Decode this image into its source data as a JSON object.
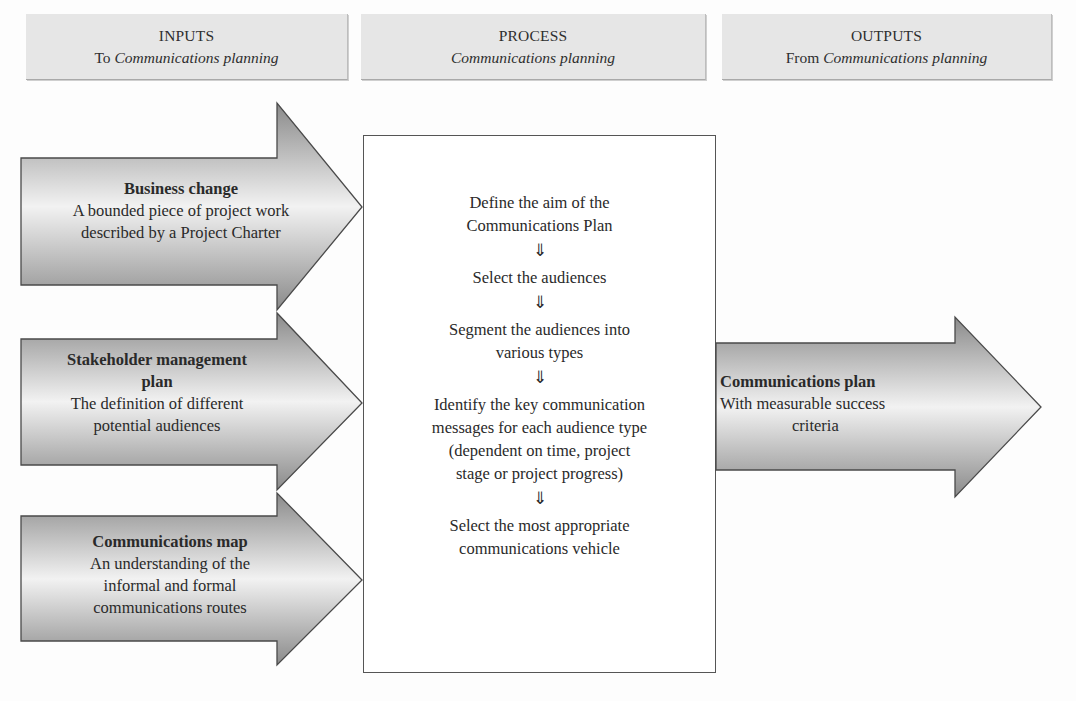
{
  "headers": {
    "inputs": {
      "title": "INPUTS",
      "prefix": "To ",
      "italic": "Communications planning"
    },
    "process": {
      "title": "PROCESS",
      "prefix": "",
      "italic": "Communications planning"
    },
    "outputs": {
      "title": "OUTPUTS",
      "prefix": "From ",
      "italic": "Communications planning"
    }
  },
  "inputs": [
    {
      "title": "Business change",
      "lines": [
        "A bounded piece of project work",
        "described by a Project Charter"
      ]
    },
    {
      "title_lines": [
        "Stakeholder management",
        "plan"
      ],
      "lines": [
        "The definition of different",
        "potential audiences"
      ]
    },
    {
      "title": "Communications map",
      "lines": [
        "An understanding of the",
        "informal and formal",
        "communications routes"
      ]
    }
  ],
  "process": {
    "arrow_glyph": "⇓",
    "steps": [
      {
        "lines": [
          "Define the aim of the",
          "Communications Plan"
        ]
      },
      {
        "lines": [
          "Select the audiences"
        ]
      },
      {
        "lines": [
          "Segment the audiences into",
          "various types"
        ]
      },
      {
        "lines": [
          "Identify the key communication",
          "messages for each audience type",
          "(dependent on time, project",
          "stage or project progress)"
        ]
      },
      {
        "lines": [
          "Select the most appropriate",
          "communications vehicle"
        ]
      }
    ]
  },
  "output": {
    "title": "Communications plan",
    "lines": [
      "With measurable success",
      "criteria"
    ]
  },
  "colors": {
    "header_bg": "#e6e6e6",
    "arrow_dark": "#8a8a8a",
    "arrow_light": "#f4f4f4",
    "border": "#555555"
  }
}
